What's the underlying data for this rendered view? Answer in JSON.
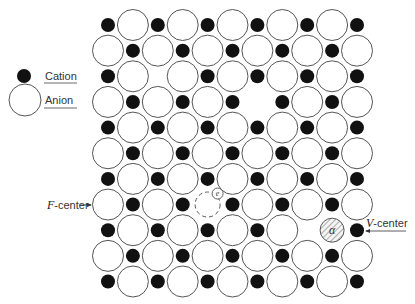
{
  "diagram": {
    "colors": {
      "cation_fill": "#111111",
      "anion_fill": "#ffffff",
      "anion_stroke": "#555555",
      "text": "#333333",
      "background": "#ffffff"
    },
    "legend": {
      "items": [
        {
          "label": "Cation",
          "symbol": "filled-small-circle"
        },
        {
          "label": "Anion",
          "symbol": "open-large-circle"
        }
      ]
    },
    "lattice": {
      "rows": 11,
      "cols": 11,
      "origin_x": 108,
      "origin_y": 25,
      "pitch_x": 24.9,
      "pitch_y": 25.65,
      "cation_radius": 7,
      "anion_radius": 15.5,
      "pattern": "rows with even index start with cation; odd index start with anion",
      "vacancies": [
        {
          "row": 2,
          "col": 2,
          "species": "cation"
        },
        {
          "row": 3,
          "col": 6,
          "species": "anion"
        },
        {
          "row": 8,
          "col": 8,
          "species": "cation"
        }
      ]
    },
    "annotations": {
      "f_center": {
        "label_prefix": "F",
        "label_suffix": "-center",
        "electron_symbol": "e",
        "row": 7,
        "col": 4
      },
      "v_center": {
        "label_prefix": "V",
        "label_suffix": "-center",
        "hole_symbol": "α",
        "row": 8,
        "col": 9
      }
    }
  }
}
